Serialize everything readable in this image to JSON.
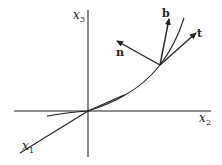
{
  "diagram": {
    "axes": [
      {
        "name": "x1",
        "base": "x",
        "sub": "1"
      },
      {
        "name": "x2",
        "base": "x",
        "sub": "2"
      },
      {
        "name": "x3",
        "base": "x",
        "sub": "3"
      }
    ],
    "vectors": [
      {
        "name": "tangent",
        "label": "t"
      },
      {
        "name": "normal",
        "label": "n"
      },
      {
        "name": "binormal",
        "label": "b"
      }
    ]
  }
}
